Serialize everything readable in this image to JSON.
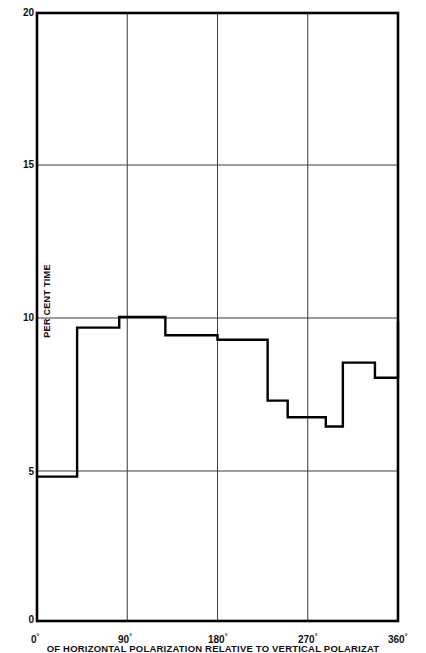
{
  "chart_data": {
    "type": "line",
    "subtype": "step",
    "title": "",
    "xlabel": "ANGLE OF HORIZONTAL POLARIZATION RELATIVE TO VERTICAL POLARIZATION",
    "ylabel": "PER CENT TIME",
    "xlim": [
      0,
      360
    ],
    "ylim": [
      0,
      20
    ],
    "xticks": [
      0,
      90,
      180,
      270,
      360
    ],
    "xtick_labels": [
      "0",
      "90",
      "180",
      "270",
      "360"
    ],
    "xtick_suffix": "°",
    "yticks": [
      0,
      5,
      10,
      15,
      20
    ],
    "ytick_labels": [
      "0",
      "5",
      "10",
      "15",
      "20"
    ],
    "grid": true,
    "grid_x": [
      90,
      180,
      270
    ],
    "grid_y": [
      5,
      10,
      15
    ],
    "legend": "none",
    "line_color": "#000000",
    "grid_color": "#3a3a3a",
    "axis_color": "#000000",
    "background": "#ffffff",
    "step_edges": [
      0,
      22,
      40,
      60,
      82,
      128,
      180,
      230,
      250,
      288,
      305,
      337,
      360
    ],
    "step_values": [
      4.75,
      4.75,
      9.65,
      9.65,
      10.0,
      9.4,
      9.25,
      7.25,
      6.7,
      6.4,
      8.5,
      8.0,
      9.85
    ],
    "steps": [
      {
        "x_start": 0,
        "x_end": 40,
        "value": 4.75
      },
      {
        "x_start": 40,
        "x_end": 82,
        "value": 9.65
      },
      {
        "x_start": 82,
        "x_end": 128,
        "value": 10.0
      },
      {
        "x_start": 128,
        "x_end": 180,
        "value": 9.4
      },
      {
        "x_start": 180,
        "x_end": 230,
        "value": 9.25
      },
      {
        "x_start": 230,
        "x_end": 250,
        "value": 7.25
      },
      {
        "x_start": 250,
        "x_end": 288,
        "value": 6.7
      },
      {
        "x_start": 288,
        "x_end": 305,
        "value": 6.4
      },
      {
        "x_start": 305,
        "x_end": 337,
        "value": 8.5
      },
      {
        "x_start": 337,
        "x_end": 360,
        "value": 8.0
      },
      {
        "x_start": 360,
        "x_end": 360,
        "value": 9.85
      }
    ]
  },
  "axes": {
    "y_label": "PER CENT TIME",
    "y_ticks": [
      "0",
      "5",
      "10",
      "15",
      "20"
    ],
    "x_ticks": [
      "0",
      "90",
      "180",
      "270",
      "360"
    ],
    "degree_symbol": "°"
  },
  "caption": {
    "text": "OF HORIZONTAL POLARIZATION RELATIVE TO VERTICAL POLARIZAT"
  }
}
